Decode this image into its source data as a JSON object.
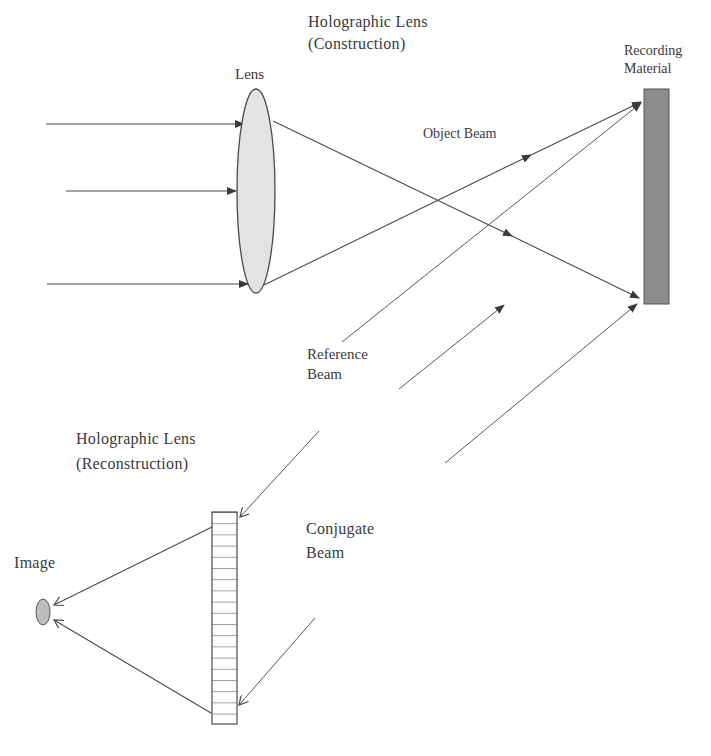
{
  "labels": {
    "construction_title_line1": "Holographic Lens",
    "construction_title_line2": "(Construction)",
    "lens": "Lens",
    "recording_material_line1": "Recording",
    "recording_material_line2": "Material",
    "object_beam": "Object Beam",
    "reference_beam_line1": "Reference",
    "reference_beam_line2": "Beam",
    "reconstruction_title_line1": "Holographic Lens",
    "reconstruction_title_line2": "(Reconstruction)",
    "conjugate_beam_line1": "Conjugate",
    "conjugate_beam_line2": "Beam",
    "image": "Image"
  },
  "colors": {
    "line": "#4a4a4a",
    "lens_fill": "#e3e3e3",
    "recording_fill": "#8c8c8c",
    "image_fill": "#bdbdbd",
    "hologram_fill": "#ffffff",
    "text": "#3a3a3a"
  },
  "diagram": {
    "nodes": [
      {
        "id": "lens",
        "label": "Lens",
        "shape": "ellipse"
      },
      {
        "id": "recording_material",
        "label": "Recording Material",
        "shape": "rect"
      },
      {
        "id": "holographic_lens",
        "label": "Holographic Lens (Reconstruction)",
        "shape": "striped-rect",
        "rows": 19
      },
      {
        "id": "image",
        "label": "Image",
        "shape": "ellipse"
      }
    ],
    "edges": [
      {
        "from": "incident_light",
        "to": "lens",
        "label": "",
        "count": 3
      },
      {
        "from": "lens",
        "to": "recording_material",
        "label": "Object Beam",
        "count": 2
      },
      {
        "from": "reference_source",
        "to": "recording_material",
        "label": "Reference Beam",
        "count": 3
      },
      {
        "from": "conjugate_source",
        "to": "holographic_lens",
        "label": "Conjugate Beam",
        "count": 2
      },
      {
        "from": "holographic_lens",
        "to": "image",
        "label": "",
        "count": 2
      }
    ]
  }
}
